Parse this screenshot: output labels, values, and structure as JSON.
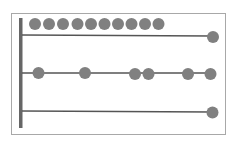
{
  "diagram": {
    "type": "abacus",
    "colors": {
      "background": "#ffffff",
      "frame": "#9a9a9a",
      "rod": "#5a5a5a",
      "post": "#666666",
      "bead": "#808080"
    },
    "rows": [
      {
        "name": "top-row",
        "bead_count_left": 10,
        "bead_count_right": 1
      },
      {
        "name": "middle-row",
        "bead_count": 6
      },
      {
        "name": "bottom-row",
        "bead_count_right": 1
      }
    ]
  }
}
